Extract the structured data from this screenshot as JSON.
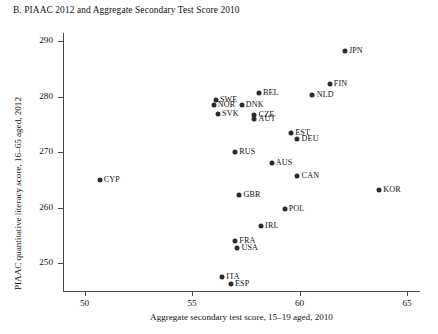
{
  "chart_data": {
    "type": "scatter",
    "title": "B. PIAAC 2012 and Aggregate Secondary Test Score 2010",
    "xlabel": "Aggregate secondary test score, 15–19 aged, 2010",
    "ylabel": "PIAAC quantitative literacy score, 16–65 aged, 2012",
    "xlim": [
      49.0,
      65.6
    ],
    "ylim": [
      245.0,
      291.5
    ],
    "xticks": [
      50,
      55,
      60,
      65
    ],
    "yticks": [
      250,
      260,
      270,
      280,
      290
    ],
    "grid": false,
    "legend": "none",
    "points": [
      {
        "label": "JPN",
        "x": 62.1,
        "y": 288.2,
        "label_pos": "right"
      },
      {
        "label": "FIN",
        "x": 61.4,
        "y": 282.3,
        "label_pos": "right"
      },
      {
        "label": "NLD",
        "x": 60.6,
        "y": 280.3,
        "label_pos": "right"
      },
      {
        "label": "BEL",
        "x": 58.1,
        "y": 280.6,
        "label_pos": "right"
      },
      {
        "label": "SWE",
        "x": 56.1,
        "y": 279.4,
        "label_pos": "right"
      },
      {
        "label": "NOR",
        "x": 56.0,
        "y": 278.6,
        "label_pos": "right"
      },
      {
        "label": "DNK",
        "x": 57.3,
        "y": 278.5,
        "label_pos": "right"
      },
      {
        "label": "SVK",
        "x": 56.2,
        "y": 276.9,
        "label_pos": "right"
      },
      {
        "label": "CZE",
        "x": 57.9,
        "y": 276.8,
        "label_pos": "right"
      },
      {
        "label": "AUT",
        "x": 57.9,
        "y": 276.0,
        "label_pos": "right"
      },
      {
        "label": "EST",
        "x": 59.6,
        "y": 273.5,
        "label_pos": "right"
      },
      {
        "label": "DEU",
        "x": 59.9,
        "y": 272.4,
        "label_pos": "right"
      },
      {
        "label": "RUS",
        "x": 57.0,
        "y": 270.0,
        "label_pos": "right"
      },
      {
        "label": "CYP",
        "x": 50.7,
        "y": 265.0,
        "label_pos": "right"
      },
      {
        "label": "AUS",
        "x": 58.7,
        "y": 268.1,
        "label_pos": "right"
      },
      {
        "label": "CAN",
        "x": 59.9,
        "y": 265.8,
        "label_pos": "right"
      },
      {
        "label": "KOR",
        "x": 63.7,
        "y": 263.2,
        "label_pos": "right"
      },
      {
        "label": "GBR",
        "x": 57.2,
        "y": 262.3,
        "label_pos": "right"
      },
      {
        "label": "POL",
        "x": 59.3,
        "y": 259.8,
        "label_pos": "right"
      },
      {
        "label": "IRL",
        "x": 58.2,
        "y": 256.8,
        "label_pos": "right"
      },
      {
        "label": "FRA",
        "x": 57.0,
        "y": 254.1,
        "label_pos": "right"
      },
      {
        "label": "USA",
        "x": 57.1,
        "y": 252.8,
        "label_pos": "right"
      },
      {
        "label": "ITA",
        "x": 56.4,
        "y": 247.6,
        "label_pos": "right"
      },
      {
        "label": "ESP",
        "x": 56.8,
        "y": 246.2,
        "label_pos": "right"
      }
    ]
  }
}
